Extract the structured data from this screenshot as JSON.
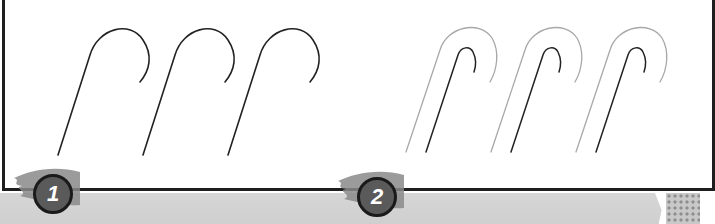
{
  "steps": [
    {
      "number": "1",
      "description": "three single-stroke cane hook outlines"
    },
    {
      "number": "2",
      "description": "three double-stroke cane hook outlines (outer grey, inner dark)"
    }
  ],
  "colors": {
    "panel_border": "#1e1e1e",
    "stroke_dark": "#222222",
    "stroke_grey": "#a0a0a0",
    "badge_fill": "#5a5a5a",
    "badge_border": "#1a1a1a",
    "bottom_strip": "#d2d2d2"
  }
}
